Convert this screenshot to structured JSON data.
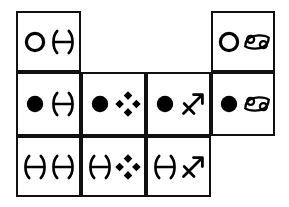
{
  "diagram": {
    "background_color": "#ffffff",
    "line_color": "#111111",
    "symbol_color": "#000000",
    "grid": {
      "columns_x": [
        16,
        81,
        146,
        211,
        275
      ],
      "rows_y": [
        11,
        72,
        136,
        197
      ],
      "row_cell_counts": [
        {
          "row": 1,
          "filled_columns": [
            1,
            4
          ]
        },
        {
          "row": 2,
          "filled_columns": [
            1,
            2,
            3,
            4
          ]
        },
        {
          "row": 3,
          "filled_columns": [
            1,
            2,
            3
          ]
        }
      ]
    },
    "symbol_legend": [
      {
        "key": "open-circle",
        "name": "hollow-circle-symbol",
        "description": "Open white circle with black outline"
      },
      {
        "key": "filled-circle",
        "name": "filled-circle-symbol",
        "description": "Solid black circle"
      },
      {
        "key": "pisces",
        "name": "pisces-symbol",
        "description": "Pisces glyph: two opposing arcs joined by a horizontal bar"
      },
      {
        "key": "cancer",
        "name": "cancer-symbol",
        "description": "Cancer glyph: the 69 shape with two spiral loops"
      },
      {
        "key": "diamonds",
        "name": "four-diamond-cluster-symbol",
        "description": "Four solid diamonds arranged in a diamond cluster"
      },
      {
        "key": "sagittarius",
        "name": "sagittarius-symbol",
        "description": "Sagittarius glyph: arrow pointing up-right with a crossbar"
      }
    ],
    "cells": [
      {
        "id": "cell-r1c1",
        "row": 1,
        "column": 1,
        "x": 16,
        "y": 11,
        "width": 65,
        "height": 61,
        "symbols": [
          "open-circle",
          "pisces"
        ],
        "label": "open circle and Pisces"
      },
      {
        "id": "cell-r1c4",
        "row": 1,
        "column": 4,
        "x": 211,
        "y": 11,
        "width": 64,
        "height": 61,
        "symbols": [
          "open-circle",
          "cancer"
        ],
        "label": "open circle and Cancer"
      },
      {
        "id": "cell-r2c1",
        "row": 2,
        "column": 1,
        "x": 16,
        "y": 72,
        "width": 65,
        "height": 64,
        "symbols": [
          "filled-circle",
          "pisces"
        ],
        "label": "filled circle and Pisces"
      },
      {
        "id": "cell-r2c2",
        "row": 2,
        "column": 2,
        "x": 81,
        "y": 72,
        "width": 65,
        "height": 64,
        "symbols": [
          "filled-circle",
          "diamonds"
        ],
        "label": "filled circle and four-diamond cluster"
      },
      {
        "id": "cell-r2c3",
        "row": 2,
        "column": 3,
        "x": 146,
        "y": 72,
        "width": 65,
        "height": 64,
        "symbols": [
          "filled-circle",
          "sagittarius"
        ],
        "label": "filled circle and Sagittarius"
      },
      {
        "id": "cell-r2c4",
        "row": 2,
        "column": 4,
        "x": 211,
        "y": 72,
        "width": 64,
        "height": 64,
        "symbols": [
          "filled-circle",
          "cancer"
        ],
        "label": "filled circle and Cancer"
      },
      {
        "id": "cell-r3c1",
        "row": 3,
        "column": 1,
        "x": 16,
        "y": 136,
        "width": 65,
        "height": 61,
        "symbols": [
          "pisces",
          "pisces"
        ],
        "label": "Pisces and Pisces"
      },
      {
        "id": "cell-r3c2",
        "row": 3,
        "column": 2,
        "x": 81,
        "y": 136,
        "width": 65,
        "height": 61,
        "symbols": [
          "pisces",
          "diamonds"
        ],
        "label": "Pisces and four-diamond cluster"
      },
      {
        "id": "cell-r3c3",
        "row": 3,
        "column": 3,
        "x": 146,
        "y": 136,
        "width": 65,
        "height": 61,
        "symbols": [
          "pisces",
          "sagittarius"
        ],
        "label": "Pisces and Sagittarius"
      }
    ]
  }
}
